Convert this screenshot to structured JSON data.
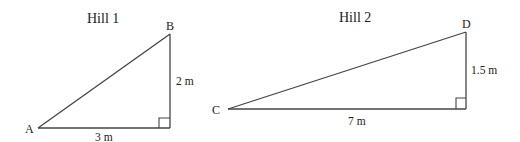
{
  "colors": {
    "line": "#444444",
    "text": "#222222",
    "background": "#ffffff"
  },
  "hill1": {
    "title": "Hill 1",
    "vertices": {
      "A": "A",
      "B": "B"
    },
    "height_label": "2 m",
    "base_label": "3 m",
    "right_angle": true
  },
  "hill2": {
    "title": "Hill 2",
    "vertices": {
      "C": "C",
      "D": "D"
    },
    "height_label": "1.5 m",
    "base_label": "7 m",
    "right_angle": true
  }
}
